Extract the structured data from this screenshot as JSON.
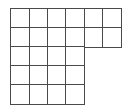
{
  "diagram": {
    "type": "grid-shape",
    "origin": {
      "x": 11,
      "y": 9
    },
    "cell_width": 18.33,
    "cell_height": 19,
    "line_color": "#4a4a4a",
    "rows": [
      {
        "row": 1,
        "columns": 6
      },
      {
        "row": 2,
        "columns": 6
      },
      {
        "row": 3,
        "columns": 4
      },
      {
        "row": 4,
        "columns": 4
      },
      {
        "row": 5,
        "columns": 4
      }
    ],
    "total_cells": 24
  }
}
